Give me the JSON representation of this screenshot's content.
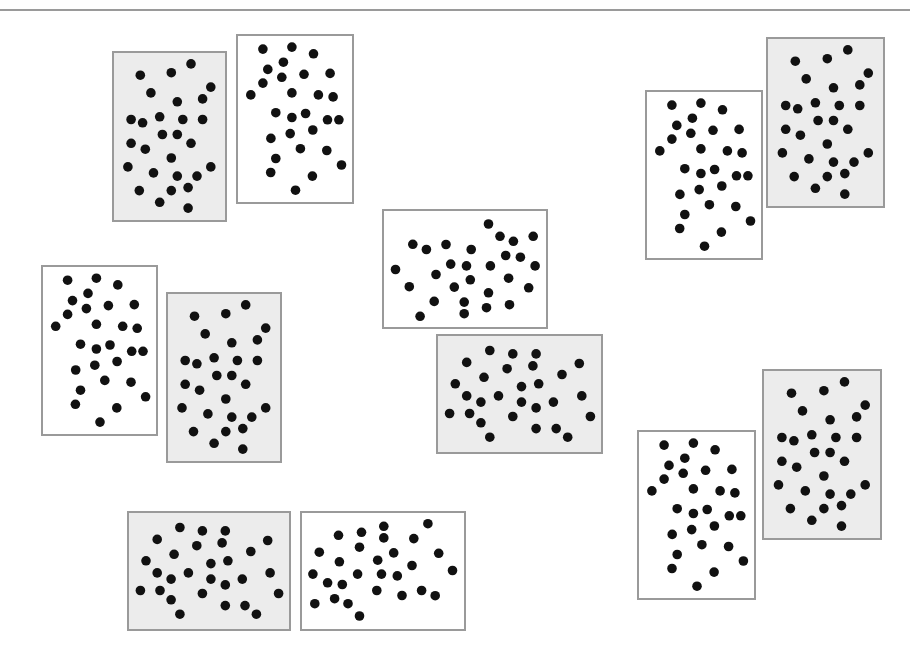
{
  "diagram": {
    "colors": {
      "white_card_fill": "#ffffff",
      "gray_card_fill": "#ececec",
      "border": "#9a9a9a",
      "dot": "#111111",
      "rule": "#9a9a9a"
    },
    "patterns": {
      "white": {
        "dot_count": 28,
        "dots": [
          [
            0.218,
            0.079
          ],
          [
            0.473,
            0.067
          ],
          [
            0.662,
            0.107
          ],
          [
            0.398,
            0.158
          ],
          [
            0.261,
            0.201
          ],
          [
            0.384,
            0.249
          ],
          [
            0.579,
            0.231
          ],
          [
            0.808,
            0.225
          ],
          [
            0.218,
            0.284
          ],
          [
            0.112,
            0.355
          ],
          [
            0.473,
            0.343
          ],
          [
            0.705,
            0.355
          ],
          [
            0.834,
            0.367
          ],
          [
            0.332,
            0.462
          ],
          [
            0.473,
            0.491
          ],
          [
            0.593,
            0.467
          ],
          [
            0.785,
            0.505
          ],
          [
            0.885,
            0.505
          ],
          [
            0.289,
            0.617
          ],
          [
            0.458,
            0.588
          ],
          [
            0.656,
            0.566
          ],
          [
            0.547,
            0.679
          ],
          [
            0.779,
            0.69
          ],
          [
            0.332,
            0.738
          ],
          [
            0.908,
            0.777
          ],
          [
            0.287,
            0.822
          ],
          [
            0.653,
            0.844
          ],
          [
            0.504,
            0.929
          ]
        ]
      },
      "gray": {
        "dot_count": 28,
        "dots": [
          [
            0.694,
            0.065
          ],
          [
            0.237,
            0.133
          ],
          [
            0.516,
            0.118
          ],
          [
            0.872,
            0.204
          ],
          [
            0.332,
            0.239
          ],
          [
            0.57,
            0.292
          ],
          [
            0.798,
            0.275
          ],
          [
            0.154,
            0.398
          ],
          [
            0.258,
            0.418
          ],
          [
            0.412,
            0.382
          ],
          [
            0.62,
            0.398
          ],
          [
            0.798,
            0.398
          ],
          [
            0.436,
            0.488
          ],
          [
            0.57,
            0.488
          ],
          [
            0.154,
            0.541
          ],
          [
            0.694,
            0.541
          ],
          [
            0.282,
            0.576
          ],
          [
            0.516,
            0.629
          ],
          [
            0.125,
            0.682
          ],
          [
            0.872,
            0.682
          ],
          [
            0.356,
            0.718
          ],
          [
            0.57,
            0.737
          ],
          [
            0.748,
            0.737
          ],
          [
            0.228,
            0.824
          ],
          [
            0.516,
            0.824
          ],
          [
            0.668,
            0.806
          ],
          [
            0.412,
            0.894
          ],
          [
            0.668,
            0.929
          ]
        ]
      }
    },
    "cards": [
      {
        "id": "card-1",
        "pattern": "gray",
        "orientation": "portrait",
        "group": "top-left-pair"
      },
      {
        "id": "card-2",
        "pattern": "white",
        "orientation": "portrait",
        "group": "top-left-pair"
      },
      {
        "id": "card-3",
        "pattern": "white",
        "orientation": "portrait",
        "group": "mid-left-pair"
      },
      {
        "id": "card-4",
        "pattern": "gray",
        "orientation": "portrait",
        "group": "mid-left-pair"
      },
      {
        "id": "card-5",
        "pattern": "white",
        "orientation": "rotated-cw",
        "group": "center-pair"
      },
      {
        "id": "card-6",
        "pattern": "gray",
        "orientation": "rotated-cw",
        "group": "center-pair"
      },
      {
        "id": "card-7",
        "pattern": "white",
        "orientation": "portrait",
        "group": "top-right-pair"
      },
      {
        "id": "card-8",
        "pattern": "gray",
        "orientation": "portrait",
        "group": "top-right-pair"
      },
      {
        "id": "card-9",
        "pattern": "white",
        "orientation": "portrait",
        "group": "bottom-right-pair"
      },
      {
        "id": "card-10",
        "pattern": "gray",
        "orientation": "portrait",
        "group": "bottom-right-pair"
      },
      {
        "id": "card-11",
        "pattern": "gray",
        "orientation": "rotated-cw",
        "group": "bottom-pair"
      },
      {
        "id": "card-12",
        "pattern": "white",
        "orientation": "rotated-ccw",
        "group": "bottom-pair"
      }
    ]
  }
}
